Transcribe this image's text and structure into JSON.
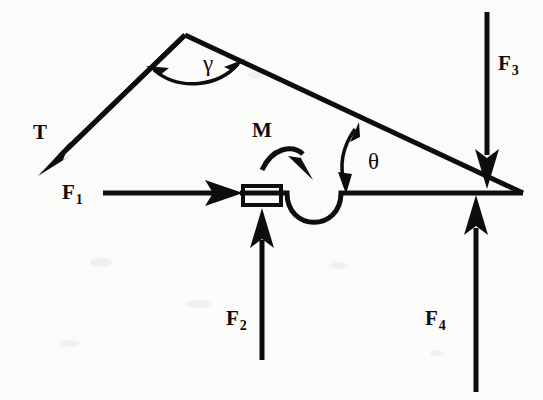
{
  "figure": {
    "type": "free-body-diagram",
    "background_color": "#fbfbfa",
    "ink_color": "#0d0d0d"
  },
  "labels": {
    "tension": {
      "text": "T",
      "sub": "",
      "x": 33,
      "y": 122
    },
    "force1": {
      "text": "F",
      "sub": "1",
      "x": 62,
      "y": 182
    },
    "force2": {
      "text": "F",
      "sub": "2",
      "x": 226,
      "y": 308
    },
    "force3": {
      "text": "F",
      "sub": "3",
      "x": 498,
      "y": 53
    },
    "force4": {
      "text": "F",
      "sub": "4",
      "x": 425,
      "y": 308
    },
    "moment": {
      "text": "M",
      "sub": "",
      "x": 252,
      "y": 120
    },
    "gamma": {
      "text": "γ",
      "sub": "",
      "x": 203,
      "y": 52
    },
    "theta": {
      "text": "θ",
      "sub": "",
      "x": 368,
      "y": 150
    }
  },
  "geometry": {
    "apex": {
      "x": 185,
      "y": 35
    },
    "right_vertex": {
      "x": 523,
      "y": 193
    },
    "baseline_y": 193,
    "baseline_left_x": 240,
    "block": {
      "x": 243,
      "y": 186,
      "width": 38,
      "height": 19
    },
    "notch": {
      "start_x": 287,
      "end_x": 341,
      "bottom_y": 229
    }
  },
  "vectors": [
    {
      "name": "T",
      "label": "T",
      "direction": "down-left",
      "tail": {
        "x": 185,
        "y": 35
      },
      "tip": {
        "x": 40,
        "y": 174
      }
    },
    {
      "name": "F1",
      "label": "F₁",
      "direction": "right",
      "tail": {
        "x": 103,
        "y": 193
      },
      "tip": {
        "x": 243,
        "y": 193
      }
    },
    {
      "name": "F2",
      "label": "F₂",
      "direction": "up",
      "tail": {
        "x": 262,
        "y": 360
      },
      "tip": {
        "x": 262,
        "y": 207
      }
    },
    {
      "name": "F3",
      "label": "F₃",
      "direction": "down",
      "tail": {
        "x": 487,
        "y": 12
      },
      "tip": {
        "x": 487,
        "y": 187
      }
    },
    {
      "name": "F4",
      "label": "F₄",
      "direction": "up",
      "tail": {
        "x": 476,
        "y": 392
      },
      "tip": {
        "x": 476,
        "y": 194
      }
    }
  ],
  "angles": [
    {
      "name": "gamma",
      "label": "γ",
      "vertex": {
        "x": 185,
        "y": 35
      },
      "arc": "double-headed",
      "between": [
        "T-member",
        "right-member"
      ]
    },
    {
      "name": "theta",
      "label": "θ",
      "vertex": {
        "x": 345,
        "y": 193
      },
      "arc": "double-headed",
      "between": [
        "right-member",
        "baseline"
      ]
    }
  ],
  "moment": {
    "name": "M",
    "label": "M",
    "sense": "clockwise",
    "arc_start": {
      "x": 264,
      "y": 168
    },
    "arc_end": {
      "x": 311,
      "y": 158
    }
  }
}
